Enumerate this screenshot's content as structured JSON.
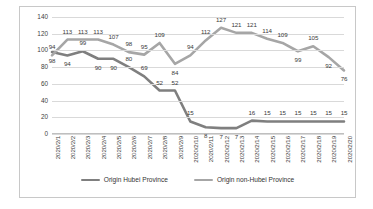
{
  "chart_data": {
    "type": "line",
    "title": "",
    "xlabel": "",
    "ylabel": "",
    "ylim": [
      0,
      140
    ],
    "ytick_step": 20,
    "yticks": [
      "0",
      "20",
      "40",
      "60",
      "80",
      "100",
      "120",
      "140"
    ],
    "grid": true,
    "legend_position": "bottom-center",
    "categories": [
      "2020/2/1",
      "2020/2/2",
      "2020/2/3",
      "2020/2/4",
      "2020/2/5",
      "2020/2/6",
      "2020/2/7",
      "2020/2/8",
      "2020/2/9",
      "2020/2/10",
      "2020/2/11",
      "2020/2/12",
      "2020/2/13",
      "2020/2/14",
      "2020/2/15",
      "2020/2/16",
      "2020/2/17",
      "2020/2/18",
      "2020/2/19",
      "2020/2/20"
    ],
    "series": [
      {
        "name": "Origin Hubei Province",
        "color": "#7f7f7f",
        "values": [
          98,
          94,
          99,
          90,
          90,
          80,
          69,
          52,
          52,
          15,
          8,
          7,
          7,
          16,
          15,
          15,
          15,
          15,
          15,
          15
        ],
        "label_offsets": [
          [
            0,
            9
          ],
          [
            0,
            9
          ],
          [
            0,
            -8
          ],
          [
            0,
            9
          ],
          [
            0,
            9
          ],
          [
            0,
            -8
          ],
          [
            0,
            -8
          ],
          [
            0,
            -8
          ],
          [
            0,
            -8
          ],
          [
            0,
            -8
          ],
          [
            0,
            9
          ],
          [
            0,
            9
          ],
          [
            0,
            9
          ],
          [
            0,
            -8
          ],
          [
            0,
            -8
          ],
          [
            0,
            -8
          ],
          [
            0,
            -8
          ],
          [
            0,
            -8
          ],
          [
            0,
            -8
          ],
          [
            0,
            -8
          ]
        ]
      },
      {
        "name": "Origin non-Hubei Province",
        "color": "#a6a6a6",
        "values": [
          94,
          113,
          113,
          113,
          107,
          98,
          95,
          109,
          84,
          94,
          112,
          127,
          121,
          121,
          114,
          109,
          99,
          105,
          92,
          76
        ],
        "label_offsets": [
          [
            0,
            -8
          ],
          [
            0,
            -8
          ],
          [
            0,
            -8
          ],
          [
            0,
            -8
          ],
          [
            0,
            -8
          ],
          [
            0,
            -8
          ],
          [
            0,
            -8
          ],
          [
            0,
            -8
          ],
          [
            0,
            9
          ],
          [
            0,
            -8
          ],
          [
            0,
            -8
          ],
          [
            0,
            -8
          ],
          [
            0,
            -8
          ],
          [
            0,
            -8
          ],
          [
            0,
            -8
          ],
          [
            0,
            -8
          ],
          [
            0,
            9
          ],
          [
            0,
            -8
          ],
          [
            0,
            9
          ],
          [
            0,
            9
          ]
        ]
      }
    ]
  },
  "legend": {
    "entries": [
      {
        "label": "Origin Hubei Province",
        "color": "#7f7f7f"
      },
      {
        "label": "Origin non-Hubei Province",
        "color": "#a6a6a6"
      }
    ]
  }
}
